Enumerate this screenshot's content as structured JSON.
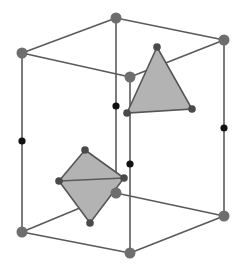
{
  "diagram": {
    "colors": {
      "background": "#ffffff",
      "edge": "#5a5a5a",
      "corner_atom": "#6e6e6e",
      "site_atom": "#4a4a4a",
      "black_atom": "#111111",
      "polyhedron_fill": "#b3b3b3",
      "polyhedron_stroke": "#555555"
    },
    "corners": {
      "top_left": [
        22,
        53
      ],
      "top_back": [
        116,
        18
      ],
      "top_right": [
        224,
        40
      ],
      "top_front": [
        130,
        77
      ],
      "bottom_left": [
        22,
        232
      ],
      "bottom_back": [
        116,
        193
      ],
      "bottom_right": [
        224,
        216
      ],
      "bottom_front": [
        130,
        253
      ]
    },
    "edge_dots": [
      {
        "name": "left-edge-dot",
        "pos": [
          22,
          141
        ]
      },
      {
        "name": "back-edge-dot",
        "pos": [
          116,
          106
        ]
      },
      {
        "name": "right-edge-dot",
        "pos": [
          224,
          128
        ]
      },
      {
        "name": "front-edge-dot",
        "pos": [
          130,
          164
        ]
      }
    ],
    "tetrahedral_face": {
      "vertices": [
        [
          157,
          47
        ],
        [
          127,
          113
        ],
        [
          192,
          109
        ]
      ]
    },
    "octahedral_site": {
      "vertices": {
        "top": [
          85,
          150
        ],
        "left": [
          59,
          181
        ],
        "right": [
          124,
          178
        ],
        "bottom": [
          90,
          223
        ]
      }
    }
  }
}
